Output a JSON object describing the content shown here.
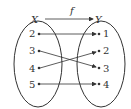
{
  "diagram": {
    "function_label": "f",
    "domain_label": "X",
    "codomain_label": "Y",
    "domain": [
      "2",
      "3",
      "4",
      "5"
    ],
    "codomain": [
      "1",
      "2",
      "3",
      "4"
    ],
    "mapping": [
      {
        "from": "2",
        "to": "1"
      },
      {
        "from": "3",
        "to": "3"
      },
      {
        "from": "4",
        "to": "2"
      },
      {
        "from": "5",
        "to": "4"
      }
    ],
    "line_color": "#333333"
  }
}
